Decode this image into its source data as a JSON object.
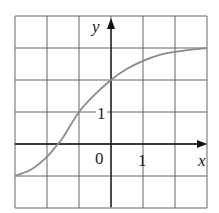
{
  "chart_data": {
    "type": "line",
    "title": "",
    "xlabel": "x",
    "ylabel": "y",
    "xlim": [
      -3,
      3
    ],
    "ylim": [
      -2,
      4
    ],
    "grid": true,
    "tick_labels": {
      "origin": "0",
      "x": [
        "1"
      ],
      "y": [
        "1"
      ]
    },
    "series": [
      {
        "name": "curve",
        "x": [
          -3,
          -2.5,
          -2,
          -1.66,
          -1.5,
          -1,
          -0.5,
          0,
          0.5,
          1,
          1.5,
          2,
          2.5,
          3
        ],
        "y": [
          -1,
          -0.8,
          -0.4,
          0,
          0.2,
          1,
          1.55,
          2,
          2.35,
          2.6,
          2.78,
          2.88,
          2.95,
          3
        ]
      }
    ],
    "colors": {
      "curve": "#8a8a8a",
      "grid": "#555555",
      "axis": "#111111"
    }
  },
  "labels": {
    "x_axis": "x",
    "y_axis": "y",
    "origin": "0",
    "x_tick": "1",
    "y_tick": "1"
  }
}
